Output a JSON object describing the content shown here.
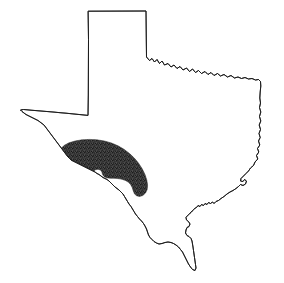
{
  "figure": {
    "type": "outline-map",
    "title": "",
    "caption": "",
    "background_color": "#ffffff",
    "outline_color": "#1a1a1a",
    "outline_width_px": 0.9,
    "width_px": 284,
    "height_px": 283,
    "has_labels": false,
    "has_legend": false,
    "has_scale_bar": false,
    "has_north_arrow": false,
    "has_graticule": false
  },
  "state_outline": {
    "name": "texas-state-boundary",
    "fill_color": "#ffffff",
    "stroke_color": "#1a1a1a",
    "segments": [
      "panhandle-north-border",
      "panhandle-east-border",
      "red-river-north-border",
      "sabine-east-border",
      "gulf-coast",
      "rio-grande-south-border",
      "west-texas-border",
      "panhandle-west-border"
    ],
    "path": "M 88.5 11.2 L 146.0 11.0 L 146.3 40.0 L 146.5 57.0 L 149.5 60.5 L 152.0 58.5 L 154.5 62.0 L 157.0 59.5 L 159.5 63.5 L 162.0 61.0 L 164.5 65.0 L 168.0 63.5 L 171.0 67.0 L 174.0 65.0 L 177.0 68.5 L 180.0 66.5 L 183.0 70.0 L 186.5 68.0 L 189.5 71.5 L 192.5 69.0 L 195.5 72.5 L 198.5 70.5 L 201.5 73.5 L 205.0 71.5 L 208.0 74.5 L 211.0 72.5 L 214.0 75.5 L 217.5 73.5 L 220.5 76.0 L 224.0 74.5 L 227.5 77.0 L 231.0 75.5 L 234.5 78.0 L 238.0 77.0 L 241.5 78.5 L 245.0 77.5 L 248.5 79.0 L 252.0 78.5 L 255.5 80.0 L 258.5 79.5 L 260.5 81.5 L 260.8 86.0 L 260.2 92.0 L 259.8 98.0 L 260.5 103.0 L 259.5 107.5 L 260.8 112.0 L 259.5 116.5 L 260.8 121.0 L 259.2 125.0 L 260.5 129.5 L 259.0 133.5 L 260.2 137.5 L 258.5 141.0 L 259.8 145.0 L 257.5 148.5 L 258.8 152.0 L 256.5 155.5 L 257.8 159.0 L 255.0 162.0 L 253.5 165.5 L 250.5 168.0 L 248.5 171.0 L 246.0 173.5 L 243.5 176.0 L 241.0 178.5 L 240.5 181.0 L 243.0 181.5 L 244.5 179.5 L 246.5 181.0 L 245.5 184.0 L 243.0 185.5 L 240.5 184.5 L 238.5 186.5 L 236.0 188.5 L 233.0 190.5 L 230.0 192.0 L 227.0 194.0 L 224.0 196.5 L 221.0 198.5 L 218.5 200.5 L 216.0 201.5 L 214.0 203.5 L 212.5 202.0 L 210.5 203.5 L 208.5 202.5 L 207.0 204.5 L 205.0 203.5 L 203.5 205.5 L 201.5 204.5 L 200.0 206.5 L 198.0 205.5 L 196.5 207.5 L 194.5 208.5 L 193.0 210.5 L 191.0 212.0 L 189.5 214.0 L 187.5 215.5 L 186.0 217.5 L 186.5 220.0 L 188.5 221.5 L 190.0 224.0 L 189.0 226.5 L 187.0 227.5 L 186.0 230.0 L 185.5 233.0 L 187.0 235.5 L 189.0 236.5 L 191.0 238.5 L 192.0 241.0 L 192.5 244.0 L 193.0 247.0 L 193.5 250.5 L 194.0 254.0 L 194.5 257.5 L 195.0 261.0 L 195.5 264.5 L 196.0 268.0 L 195.0 270.5 L 192.5 269.5 L 190.5 267.0 L 188.5 264.0 L 187.0 261.0 L 185.5 258.0 L 184.0 255.0 L 182.5 252.0 L 180.5 249.5 L 178.5 247.0 L 176.0 245.0 L 173.5 243.5 L 171.0 242.5 L 168.0 242.0 L 165.0 242.5 L 162.0 243.5 L 159.0 244.0 L 156.5 243.0 L 154.0 241.5 L 152.0 239.5 L 150.0 237.5 L 148.5 235.0 L 147.5 232.0 L 146.5 229.0 L 145.0 226.0 L 143.5 223.5 L 141.5 221.0 L 139.5 219.0 L 137.5 216.5 L 135.5 214.0 L 134.0 211.5 L 132.5 209.0 L 131.0 206.5 L 129.0 204.0 L 127.5 201.5 L 126.0 199.0 L 124.5 196.5 L 123.0 194.0 L 121.0 192.0 L 119.0 190.0 L 117.0 188.5 L 115.0 187.0 L 113.0 185.0 L 111.0 183.0 L 109.0 181.0 L 107.0 179.5 L 105.0 178.5 L 103.0 177.5 L 101.0 176.0 L 99.0 174.5 L 97.0 173.5 L 95.0 172.0 L 93.0 171.0 L 91.0 170.0 L 89.0 169.0 L 87.0 168.0 L 85.0 167.0 L 83.0 166.0 L 81.0 165.0 L 79.0 164.0 L 77.0 163.0 L 75.0 162.0 L 73.0 161.0 L 71.0 160.0 L 69.5 158.5 L 68.0 157.0 L 66.5 155.0 L 65.0 153.0 L 63.5 151.0 L 62.0 149.0 L 60.5 147.0 L 59.0 145.0 L 57.5 143.0 L 56.0 141.0 L 54.5 139.0 L 53.0 137.0 L 51.5 135.0 L 50.0 133.0 L 48.5 131.0 L 47.0 129.0 L 45.5 127.0 L 44.0 125.0 L 42.0 123.5 L 40.0 122.0 L 38.0 120.5 L 36.0 119.5 L 34.0 118.5 L 32.0 117.5 L 30.0 116.5 L 28.0 115.5 L 26.0 114.5 L 24.0 113.0 L 22.0 111.5 L 20.5 110.0 L 23.5 109.5 L 27.0 109.8 L 31.0 110.2 L 36.0 110.6 L 42.0 111.1 L 48.0 111.6 L 54.0 112.1 L 60.0 112.7 L 66.0 113.2 L 72.0 113.8 L 78.0 114.4 L 83.0 114.9 L 88.0 115.4 L 88.3 95.0 L 88.4 70.0 L 88.5 40.0 Z"
  },
  "shaded_region": {
    "name": "edwards-plateau-hill-country",
    "label": "",
    "fill_style": "stipple",
    "fill_color": "#4a4a4a",
    "dot_color": "#111111",
    "stroke_color": "#2b2b2b",
    "opacity": 1,
    "approx_bounds_px": {
      "x": 58,
      "y": 139,
      "width": 92,
      "height": 58
    },
    "path": "M 62.5 163.0 L 60.0 158.5 L 59.0 153.5 L 60.5 149.0 L 64.0 145.5 L 69.0 142.8 L 75.0 141.0 L 82.0 139.8 L 89.5 139.4 L 97.0 139.8 L 104.5 141.0 L 111.5 143.0 L 118.0 145.8 L 124.0 149.3 L 129.5 153.5 L 134.5 158.3 L 138.8 163.5 L 142.3 169.0 L 145.0 174.5 L 146.8 180.0 L 147.6 185.0 L 147.2 189.5 L 145.5 193.0 L 142.8 195.5 L 139.5 196.5 L 136.5 195.8 L 134.5 193.8 L 133.3 191.0 L 132.3 187.8 L 130.8 184.8 L 128.5 182.3 L 125.5 180.5 L 122.0 179.3 L 118.0 178.6 L 114.0 178.3 L 110.0 178.2 L 106.5 177.8 L 104.0 176.5 L 102.5 174.3 L 101.8 171.8 L 100.5 170.0 L 98.0 169.3 L 95.5 169.8 L 93.5 171.3 L 92.0 173.0 L 90.0 174.0 L 87.5 173.8 L 85.8 172.3 L 84.8 170.3 L 83.3 168.8 L 81.0 168.5 L 78.8 169.5 L 77.0 171.3 L 75.3 173.3 L 73.5 175.3 L 71.3 177.0 L 68.8 178.3 L 66.3 178.8 L 64.3 178.3 L 63.0 176.5 L 62.5 174.0 L 62.8 171.0 L 63.0 167.5 Z"
  },
  "inner_notch": {
    "name": "crescent-inner-notch",
    "description": "white concave cut on lower edge of shaded crescent"
  }
}
